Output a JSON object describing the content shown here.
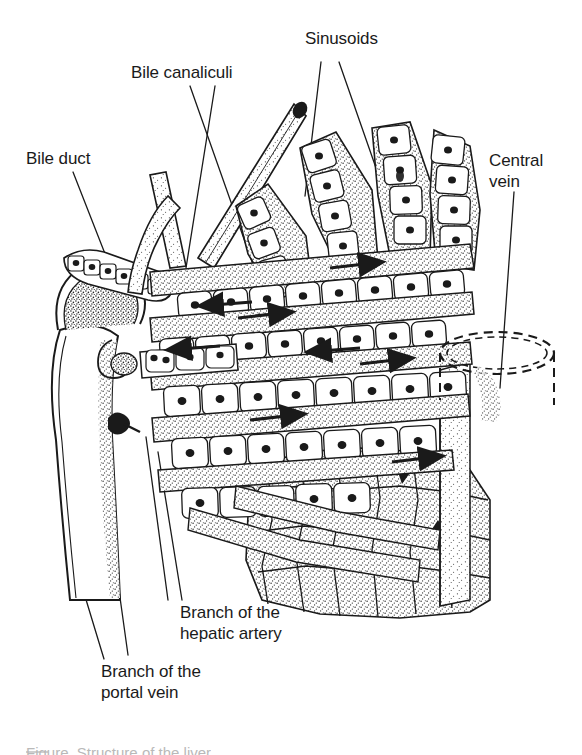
{
  "figure": {
    "background_color": "#ffffff",
    "ink_color": "#1a1a1a",
    "stipple_color": "#2b2b2b",
    "width": 582,
    "height": 755
  },
  "labels": {
    "sinusoids": {
      "text": "Sinusoids",
      "x": 305,
      "y": 38
    },
    "bile_canaliculi": {
      "text": "Bile canaliculi",
      "x": 131,
      "y": 72
    },
    "bile_duct": {
      "text": "Bile duct",
      "x": 26,
      "y": 158
    },
    "central_vein_line1": {
      "text": "Central",
      "x": 489,
      "y": 160
    },
    "central_vein_line2": {
      "text": "vein",
      "x": 489,
      "y": 181
    },
    "hepatic_artery_line1": {
      "text": "Branch of the",
      "x": 180,
      "y": 612
    },
    "hepatic_artery_line2": {
      "text": "hepatic artery",
      "x": 180,
      "y": 633
    },
    "portal_vein_line1": {
      "text": "Branch of the",
      "x": 101,
      "y": 671
    },
    "portal_vein_line2": {
      "text": "portal vein",
      "x": 101,
      "y": 692
    }
  },
  "caption": {
    "text": "Figure  Structure of the liver"
  },
  "structures": {
    "central_vein": {
      "name": "central-vein-cylinder",
      "style": "dashed-ellipse-cylinder",
      "cx": 497,
      "cy": 353,
      "rx": 57,
      "ry": 21
    },
    "portal_vein": {
      "name": "portal-vein-branch",
      "style": "large-pale-vessel"
    },
    "bile_duct": {
      "name": "bile-duct",
      "style": "cuboidal-epithelium-tube"
    },
    "hepatic_artery": {
      "name": "hepatic-artery-branch",
      "style": "small-thick-walled-vessel"
    }
  },
  "flow_arrows": {
    "bile_direction": "left",
    "blood_direction": "right",
    "count": 8
  }
}
